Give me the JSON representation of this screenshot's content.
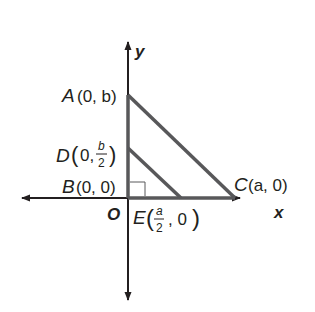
{
  "diagram": {
    "type": "coordinate-geometry",
    "axes": {
      "x_label": "x",
      "y_label": "y",
      "origin_label": "O"
    },
    "points": {
      "A": {
        "name": "A",
        "coords": "(0, b)"
      },
      "D": {
        "name": "D",
        "coords_prefix": "(0, ",
        "frac_num": "b",
        "frac_den": "2",
        "coords_suffix": ")"
      },
      "B": {
        "name": "B",
        "coords": "(0, 0)"
      },
      "C": {
        "name": "C",
        "coords": "(a, 0)"
      },
      "E": {
        "name": "E",
        "coords_prefix": "(",
        "frac_num": "a",
        "frac_den": "2",
        "coords_suffix": ", 0)"
      }
    },
    "segments": [
      "AC",
      "DE",
      "AB",
      "BC"
    ],
    "right_angle_at": "B",
    "colors": {
      "axis": "#231f20",
      "triangle": "#58585a"
    }
  }
}
